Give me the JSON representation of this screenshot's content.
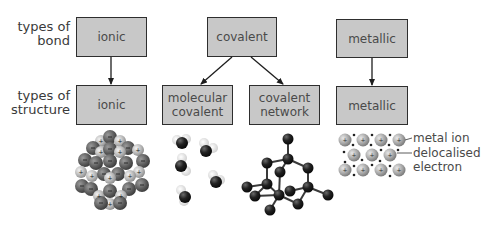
{
  "rows": {
    "bond_label": [
      "types of",
      "bond"
    ],
    "structure_label": [
      "types of",
      "structure"
    ]
  },
  "bond_types": [
    {
      "id": "ionic",
      "label": "ionic"
    },
    {
      "id": "covalent",
      "label": "covalent"
    },
    {
      "id": "metallic",
      "label": "metallic"
    }
  ],
  "structure_types": [
    {
      "id": "ionic",
      "lines": [
        "ionic"
      ]
    },
    {
      "id": "molecular-covalent",
      "lines": [
        "molecular",
        "covalent"
      ]
    },
    {
      "id": "covalent-network",
      "lines": [
        "covalent",
        "network"
      ]
    },
    {
      "id": "metallic",
      "lines": [
        "metallic"
      ]
    }
  ],
  "edges": [
    {
      "from": "ionic",
      "to": "ionic"
    },
    {
      "from": "covalent",
      "to": "molecular-covalent"
    },
    {
      "from": "covalent",
      "to": "covalent-network"
    },
    {
      "from": "metallic",
      "to": "metallic"
    }
  ],
  "annotations": {
    "metal_ion": "metal ion",
    "delocalised_electron": [
      "delocalised",
      "electron"
    ]
  },
  "colors": {
    "box_fill": "#c8c8c8",
    "box_border": "#2e2e2e",
    "text": "#3a3a3a"
  }
}
